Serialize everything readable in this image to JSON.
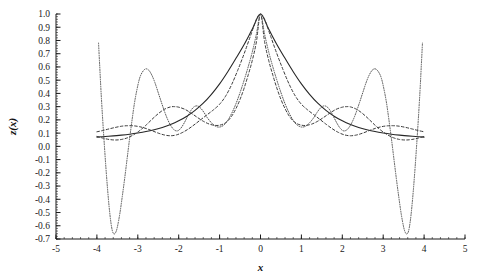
{
  "chart_data": {
    "type": "line",
    "title": "",
    "subtitle": "",
    "xlabel": "x",
    "ylabel": "z(x)",
    "xlim": [
      -5,
      5
    ],
    "ylim": [
      -0.7,
      1.0
    ],
    "grid": false,
    "legend": "none",
    "background": "#ffffff",
    "axis_color": "#1a1a1a",
    "xticks": [
      -5,
      -4,
      -3,
      -2,
      -1,
      0,
      1,
      2,
      3,
      4,
      5
    ],
    "xticklabels": [
      "-5",
      "-4",
      "-3",
      "-2",
      "-1",
      "0",
      "1",
      "2",
      "3",
      "4",
      "5"
    ],
    "xminor_step": 0.2,
    "yticks": [
      1.0,
      0.9,
      0.8,
      0.7,
      0.6,
      0.5,
      0.4,
      0.3,
      0.2,
      0.1,
      0.0,
      -0.1,
      -0.2,
      -0.3,
      -0.4,
      -0.5,
      -0.6,
      -0.7
    ],
    "yticklabels": [
      "1.0",
      "0.9",
      "0.8",
      "0.7",
      "0.6",
      "0.5",
      "0.4",
      "0.3",
      "0.2",
      "0.1",
      "0.0",
      "-0.1",
      "-0.2",
      "-0.3",
      "-0.4",
      "-0.5",
      "-0.6",
      "-0.7"
    ],
    "yminor_step": 0.02,
    "annotations": [],
    "series": [
      {
        "name": "solid-curve",
        "style": "solid",
        "color": "#262626",
        "width": 1.1,
        "x": [
          -4.0,
          -3.8,
          -3.6,
          -3.4,
          -3.2,
          -3.0,
          -2.8,
          -2.6,
          -2.4,
          -2.2,
          -2.0,
          -1.8,
          -1.6,
          -1.4,
          -1.2,
          -1.0,
          -0.8,
          -0.6,
          -0.4,
          -0.2,
          0.0,
          0.2,
          0.4,
          0.6,
          0.8,
          1.0,
          1.2,
          1.4,
          1.6,
          1.8,
          2.0,
          2.2,
          2.4,
          2.6,
          2.8,
          3.0,
          3.2,
          3.4,
          3.6,
          3.8,
          4.0
        ],
        "y": [
          0.07,
          0.074,
          0.079,
          0.085,
          0.092,
          0.101,
          0.112,
          0.126,
          0.143,
          0.165,
          0.193,
          0.228,
          0.272,
          0.326,
          0.393,
          0.472,
          0.564,
          0.665,
          0.77,
          0.886,
          1.0,
          0.886,
          0.77,
          0.665,
          0.564,
          0.472,
          0.393,
          0.326,
          0.272,
          0.228,
          0.193,
          0.165,
          0.143,
          0.126,
          0.112,
          0.101,
          0.092,
          0.085,
          0.079,
          0.074,
          0.07
        ]
      },
      {
        "name": "dashed-curve",
        "style": "dashed",
        "color": "#3a3a3a",
        "width": 1.0,
        "x": [
          -4.0,
          -3.85,
          -3.7,
          -3.55,
          -3.4,
          -3.25,
          -3.1,
          -2.95,
          -2.8,
          -2.65,
          -2.5,
          -2.35,
          -2.2,
          -2.05,
          -1.9,
          -1.75,
          -1.6,
          -1.45,
          -1.3,
          -1.15,
          -1.0,
          -0.85,
          -0.7,
          -0.55,
          -0.4,
          -0.25,
          -0.1,
          0.0,
          0.1,
          0.25,
          0.4,
          0.55,
          0.7,
          0.85,
          1.0,
          1.15,
          1.3,
          1.45,
          1.6,
          1.75,
          1.9,
          2.05,
          2.2,
          2.35,
          2.5,
          2.65,
          2.8,
          2.95,
          3.1,
          3.25,
          3.4,
          3.55,
          3.7,
          3.85,
          4.0
        ],
        "y": [
          0.11,
          0.12,
          0.132,
          0.143,
          0.152,
          0.156,
          0.155,
          0.148,
          0.135,
          0.118,
          0.1,
          0.086,
          0.08,
          0.087,
          0.106,
          0.134,
          0.168,
          0.204,
          0.24,
          0.276,
          0.318,
          0.381,
          0.47,
          0.58,
          0.7,
          0.83,
          0.96,
          1.0,
          0.96,
          0.83,
          0.7,
          0.58,
          0.47,
          0.381,
          0.318,
          0.276,
          0.24,
          0.204,
          0.168,
          0.134,
          0.106,
          0.087,
          0.08,
          0.086,
          0.1,
          0.118,
          0.135,
          0.148,
          0.155,
          0.156,
          0.152,
          0.143,
          0.132,
          0.12,
          0.11
        ]
      },
      {
        "name": "dashed-hump-curve",
        "style": "dashed",
        "color": "#3a3a3a",
        "width": 1.0,
        "x": [
          -4.0,
          -3.85,
          -3.7,
          -3.55,
          -3.4,
          -3.25,
          -3.1,
          -2.95,
          -2.8,
          -2.65,
          -2.5,
          -2.35,
          -2.2,
          -2.1,
          -2.0,
          -1.85,
          -1.7,
          -1.55,
          -1.4,
          -1.25,
          -1.1,
          -1.0,
          -0.9,
          -0.8,
          -0.7,
          -0.6,
          -0.5,
          -0.4,
          -0.3,
          -0.2,
          -0.1,
          0.0,
          0.1,
          0.2,
          0.3,
          0.4,
          0.5,
          0.6,
          0.7,
          0.8,
          0.9,
          1.0,
          1.1,
          1.25,
          1.4,
          1.55,
          1.7,
          1.85,
          2.0,
          2.1,
          2.2,
          2.35,
          2.5,
          2.65,
          2.8,
          2.95,
          3.1,
          3.25,
          3.4,
          3.55,
          3.7,
          3.85,
          4.0
        ],
        "y": [
          0.075,
          0.062,
          0.052,
          0.048,
          0.052,
          0.065,
          0.088,
          0.12,
          0.16,
          0.205,
          0.247,
          0.28,
          0.298,
          0.3,
          0.296,
          0.28,
          0.252,
          0.22,
          0.19,
          0.168,
          0.158,
          0.16,
          0.17,
          0.192,
          0.23,
          0.285,
          0.355,
          0.44,
          0.54,
          0.65,
          0.79,
          1.0,
          0.79,
          0.65,
          0.54,
          0.44,
          0.355,
          0.285,
          0.23,
          0.192,
          0.17,
          0.16,
          0.158,
          0.168,
          0.19,
          0.22,
          0.252,
          0.28,
          0.296,
          0.3,
          0.298,
          0.28,
          0.247,
          0.205,
          0.16,
          0.12,
          0.088,
          0.065,
          0.052,
          0.048,
          0.052,
          0.062,
          0.075
        ]
      },
      {
        "name": "dotted-oscillating-curve",
        "style": "dotted",
        "color": "#555555",
        "width": 1.0,
        "x": [
          -3.96,
          -3.93,
          -3.9,
          -3.86,
          -3.82,
          -3.78,
          -3.74,
          -3.7,
          -3.66,
          -3.62,
          -3.58,
          -3.54,
          -3.5,
          -3.44,
          -3.38,
          -3.32,
          -3.26,
          -3.2,
          -3.14,
          -3.08,
          -3.02,
          -2.96,
          -2.9,
          -2.82,
          -2.74,
          -2.66,
          -2.58,
          -2.5,
          -2.42,
          -2.34,
          -2.26,
          -2.18,
          -2.1,
          -2.02,
          -1.94,
          -1.86,
          -1.78,
          -1.7,
          -1.62,
          -1.54,
          -1.46,
          -1.38,
          -1.3,
          -1.2,
          -1.1,
          -1.0,
          -0.9,
          -0.8,
          -0.7,
          -0.6,
          -0.5,
          -0.4,
          -0.3,
          -0.2,
          -0.1,
          0.0,
          0.1,
          0.2,
          0.3,
          0.4,
          0.5,
          0.6,
          0.7,
          0.8,
          0.9,
          1.0,
          1.1,
          1.2,
          1.3,
          1.38,
          1.46,
          1.54,
          1.62,
          1.7,
          1.78,
          1.86,
          1.94,
          2.02,
          2.1,
          2.18,
          2.26,
          2.34,
          2.42,
          2.5,
          2.58,
          2.66,
          2.74,
          2.82,
          2.9,
          2.96,
          3.02,
          3.08,
          3.14,
          3.2,
          3.26,
          3.32,
          3.38,
          3.44,
          3.5,
          3.54,
          3.58,
          3.62,
          3.66,
          3.7,
          3.74,
          3.78,
          3.82,
          3.86,
          3.9,
          3.93,
          3.96
        ],
        "y": [
          0.78,
          0.6,
          0.42,
          0.21,
          0.02,
          -0.16,
          -0.32,
          -0.46,
          -0.57,
          -0.64,
          -0.662,
          -0.65,
          -0.61,
          -0.51,
          -0.38,
          -0.24,
          -0.09,
          0.06,
          0.2,
          0.33,
          0.43,
          0.51,
          0.555,
          0.584,
          0.578,
          0.54,
          0.48,
          0.405,
          0.33,
          0.258,
          0.196,
          0.15,
          0.122,
          0.118,
          0.14,
          0.18,
          0.228,
          0.272,
          0.3,
          0.305,
          0.288,
          0.255,
          0.216,
          0.178,
          0.152,
          0.146,
          0.16,
          0.196,
          0.252,
          0.322,
          0.406,
          0.5,
          0.602,
          0.714,
          0.848,
          1.0,
          0.848,
          0.714,
          0.602,
          0.5,
          0.406,
          0.322,
          0.252,
          0.196,
          0.16,
          0.146,
          0.152,
          0.178,
          0.216,
          0.255,
          0.288,
          0.305,
          0.3,
          0.272,
          0.228,
          0.18,
          0.14,
          0.118,
          0.122,
          0.15,
          0.196,
          0.258,
          0.33,
          0.405,
          0.48,
          0.54,
          0.578,
          0.584,
          0.555,
          0.51,
          0.43,
          0.33,
          0.2,
          0.06,
          -0.09,
          -0.24,
          -0.38,
          -0.51,
          -0.61,
          -0.65,
          -0.662,
          -0.64,
          -0.57,
          -0.46,
          -0.32,
          -0.16,
          0.02,
          0.21,
          0.42,
          0.6,
          0.78
        ]
      }
    ]
  }
}
